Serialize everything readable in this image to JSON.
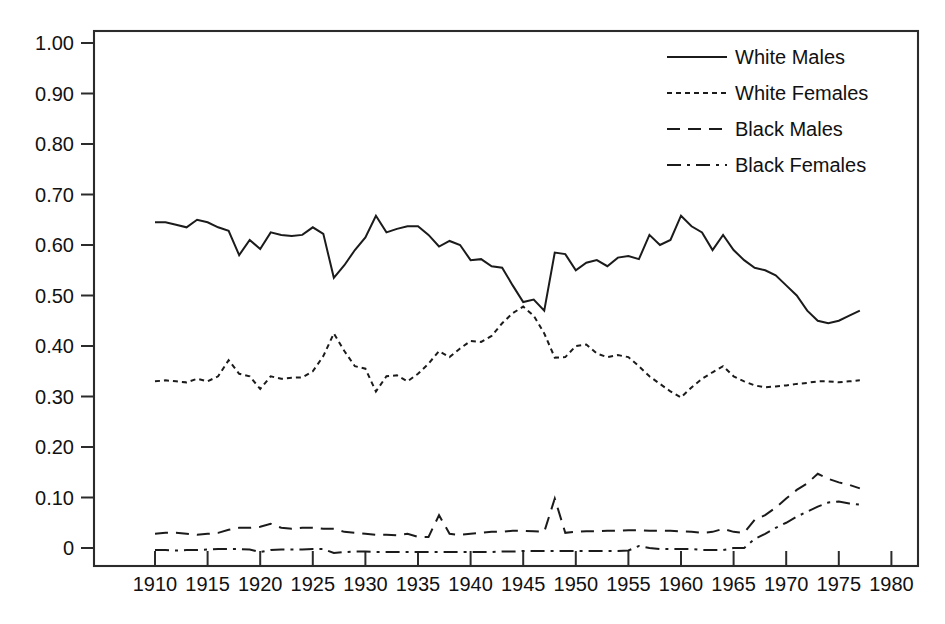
{
  "chart_data": {
    "type": "line",
    "title": "",
    "xlabel": "",
    "ylabel": "",
    "xlim": [
      1905,
      1980
    ],
    "ylim": [
      0,
      1.0
    ],
    "grid": false,
    "legend_position": "top-right",
    "x_tick_labels": [
      "1910",
      "1915",
      "1920",
      "1925",
      "1930",
      "1935",
      "1940",
      "1945",
      "1950",
      "1955",
      "1960",
      "1965",
      "1970",
      "1975",
      "1980"
    ],
    "x_ticks": [
      1910,
      1915,
      1920,
      1925,
      1930,
      1935,
      1940,
      1945,
      1950,
      1955,
      1960,
      1965,
      1970,
      1975,
      1980
    ],
    "y_tick_labels": [
      "0",
      "0.10",
      "0.20",
      "0.30",
      "0.40",
      "0.50",
      "0.60",
      "0.70",
      "0.80",
      "0.90",
      "1.00"
    ],
    "y_ticks": [
      0,
      0.1,
      0.2,
      0.3,
      0.4,
      0.5,
      0.6,
      0.7,
      0.8,
      0.9,
      1.0
    ],
    "x": [
      1910,
      1911,
      1912,
      1913,
      1914,
      1915,
      1916,
      1917,
      1918,
      1919,
      1920,
      1921,
      1922,
      1923,
      1924,
      1925,
      1926,
      1927,
      1928,
      1929,
      1930,
      1931,
      1932,
      1933,
      1934,
      1935,
      1936,
      1937,
      1938,
      1939,
      1940,
      1941,
      1942,
      1943,
      1944,
      1945,
      1946,
      1947,
      1948,
      1949,
      1950,
      1951,
      1952,
      1953,
      1954,
      1955,
      1956,
      1957,
      1958,
      1959,
      1960,
      1961,
      1962,
      1963,
      1964,
      1965,
      1966,
      1967,
      1968,
      1969,
      1970,
      1971,
      1972,
      1973,
      1974,
      1975,
      1976,
      1977
    ],
    "series": [
      {
        "name": "White Males",
        "style": "solid",
        "values": [
          0.645,
          0.645,
          0.64,
          0.635,
          0.65,
          0.645,
          0.635,
          0.628,
          0.58,
          0.61,
          0.592,
          0.625,
          0.62,
          0.618,
          0.62,
          0.635,
          0.622,
          0.535,
          0.56,
          0.59,
          0.615,
          0.658,
          0.625,
          0.632,
          0.637,
          0.637,
          0.62,
          0.597,
          0.608,
          0.6,
          0.57,
          0.572,
          0.558,
          0.555,
          0.52,
          0.487,
          0.492,
          0.47,
          0.585,
          0.582,
          0.55,
          0.565,
          0.57,
          0.558,
          0.575,
          0.578,
          0.572,
          0.62,
          0.6,
          0.61,
          0.658,
          0.637,
          0.625,
          0.59,
          0.62,
          0.59,
          0.57,
          0.555,
          0.55,
          0.54,
          0.52,
          0.5,
          0.47,
          0.45,
          0.445,
          0.45,
          0.46,
          0.47
        ]
      },
      {
        "name": "White Females",
        "style": "dotted",
        "values": [
          0.33,
          0.332,
          0.33,
          0.328,
          0.335,
          0.33,
          0.34,
          0.372,
          0.345,
          0.34,
          0.315,
          0.34,
          0.335,
          0.337,
          0.338,
          0.35,
          0.38,
          0.425,
          0.39,
          0.36,
          0.355,
          0.31,
          0.34,
          0.342,
          0.33,
          0.345,
          0.365,
          0.39,
          0.378,
          0.395,
          0.41,
          0.408,
          0.42,
          0.445,
          0.465,
          0.478,
          0.46,
          0.425,
          0.377,
          0.378,
          0.4,
          0.403,
          0.385,
          0.378,
          0.382,
          0.378,
          0.36,
          0.34,
          0.325,
          0.31,
          0.298,
          0.318,
          0.335,
          0.348,
          0.36,
          0.34,
          0.33,
          0.322,
          0.318,
          0.32,
          0.322,
          0.325,
          0.327,
          0.33,
          0.33,
          0.328,
          0.33,
          0.332
        ]
      },
      {
        "name": "Black Males",
        "style": "dashed",
        "values": [
          0.028,
          0.03,
          0.03,
          0.028,
          0.026,
          0.028,
          0.03,
          0.036,
          0.04,
          0.04,
          0.042,
          0.048,
          0.04,
          0.038,
          0.04,
          0.04,
          0.038,
          0.038,
          0.032,
          0.03,
          0.028,
          0.026,
          0.026,
          0.025,
          0.028,
          0.022,
          0.022,
          0.065,
          0.028,
          0.026,
          0.028,
          0.03,
          0.032,
          0.032,
          0.034,
          0.034,
          0.033,
          0.032,
          0.098,
          0.03,
          0.032,
          0.033,
          0.033,
          0.034,
          0.034,
          0.035,
          0.035,
          0.034,
          0.034,
          0.034,
          0.033,
          0.032,
          0.03,
          0.032,
          0.038,
          0.032,
          0.03,
          0.056,
          0.065,
          0.08,
          0.098,
          0.115,
          0.128,
          0.147,
          0.137,
          0.13,
          0.125,
          0.118
        ]
      },
      {
        "name": "Black Females",
        "style": "dashdot",
        "values": [
          -0.004,
          -0.004,
          -0.005,
          -0.004,
          -0.004,
          -0.003,
          -0.002,
          -0.002,
          -0.002,
          -0.003,
          -0.008,
          -0.004,
          -0.003,
          -0.003,
          -0.003,
          -0.002,
          -0.002,
          -0.01,
          -0.008,
          -0.007,
          -0.007,
          -0.008,
          -0.008,
          -0.008,
          -0.008,
          -0.008,
          -0.008,
          -0.008,
          -0.008,
          -0.008,
          -0.008,
          -0.008,
          -0.008,
          -0.007,
          -0.007,
          -0.006,
          -0.006,
          -0.006,
          -0.006,
          -0.006,
          -0.006,
          -0.006,
          -0.006,
          -0.006,
          -0.006,
          -0.005,
          0.004,
          0.0,
          -0.002,
          -0.002,
          -0.002,
          -0.002,
          -0.004,
          -0.004,
          -0.004,
          0.0,
          0.0,
          0.018,
          0.028,
          0.04,
          0.05,
          0.062,
          0.072,
          0.082,
          0.09,
          0.092,
          0.088,
          0.086
        ]
      }
    ]
  },
  "legend": {
    "entries": [
      {
        "label": "White Males",
        "style": "solid"
      },
      {
        "label": "White Females",
        "style": "dotted"
      },
      {
        "label": "Black Males",
        "style": "dashed"
      },
      {
        "label": "Black Females",
        "style": "dashdot"
      }
    ]
  },
  "caption": {
    "text": ""
  }
}
